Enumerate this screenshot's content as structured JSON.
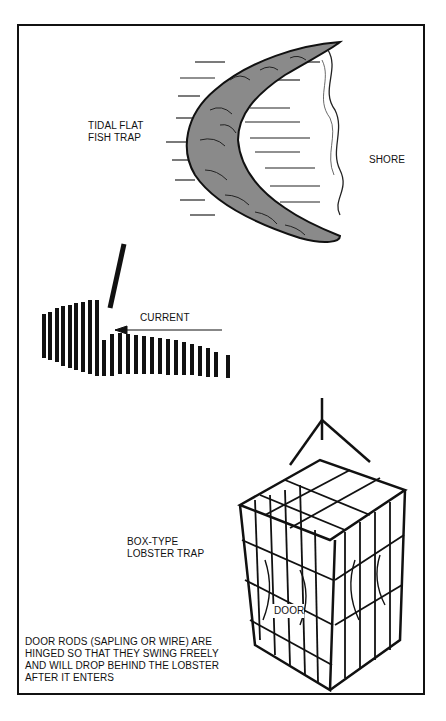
{
  "figure": {
    "labels": {
      "tidal_flat_line1": "TIDAL FLAT",
      "tidal_flat_line2": "FISH TRAP",
      "shore": "SHORE",
      "current": "CURRENT",
      "box_type_line1": "BOX-TYPE",
      "box_type_line2": "LOBSTER TRAP",
      "door": "DOOR",
      "note_line1": "DOOR RODS (SAPLING OR WIRE) ARE",
      "note_line2": "HINGED SO THAT THEY SWING FREELY",
      "note_line3": "AND WILL DROP BEHIND THE LOBSTER",
      "note_line4": "AFTER IT ENTERS"
    }
  }
}
